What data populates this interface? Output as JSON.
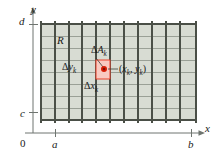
{
  "figure": {
    "colors": {
      "region_fill": "#d7dcd2",
      "grid_line": "#4a4f47",
      "grid_line_light": "#8d938a",
      "cell_fill": "#f9c9c0",
      "cell_border": "#e8402a",
      "point": "#d81e05",
      "axis": "#6f7570",
      "text": "#1a1a1a"
    },
    "axes": {
      "x_label": "x",
      "y_label": "y",
      "origin_label": "0",
      "x_ticks": [
        {
          "label": "a"
        },
        {
          "label": "b"
        }
      ],
      "y_ticks": [
        {
          "label": "d"
        },
        {
          "label": "c"
        }
      ]
    },
    "labels": {
      "region": "R",
      "delta_area": {
        "delta": "Δ",
        "base": "A",
        "sub": "k"
      },
      "delta_y": {
        "delta": "Δ",
        "base": "y",
        "sub": "k"
      },
      "delta_x": {
        "delta": "Δ",
        "base": "x",
        "sub": "k"
      },
      "sample_point": {
        "open": "(",
        "x": "x",
        "xsub": "k",
        "comma": ", ",
        "y": "y",
        "ysub": "k",
        "close": ")"
      }
    },
    "grid": {
      "columns": 11,
      "rows": 8,
      "left": 41,
      "right": 196,
      "top": 24,
      "bottom": 120,
      "x_lines": [
        41,
        55,
        69,
        82,
        96,
        110,
        124,
        138,
        152,
        166,
        180,
        196
      ],
      "y_lines": [
        24,
        36,
        48,
        60,
        72,
        84,
        96,
        108,
        120
      ],
      "highlighted_cell": {
        "x0": 96,
        "x1": 110,
        "y0": 60,
        "y1": 79
      },
      "sample_point_px": {
        "x": 110,
        "y": 69
      }
    }
  }
}
